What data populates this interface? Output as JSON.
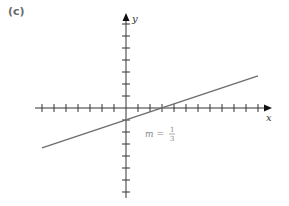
{
  "panel_label": "(c)",
  "chart_data": {
    "type": "line",
    "title": "",
    "xlabel": "x",
    "ylabel": "y",
    "xlim": [
      -7.5,
      12
    ],
    "ylim": [
      -7.5,
      7.5
    ],
    "grid": false,
    "ticks_every": 1,
    "series": [
      {
        "name": "line",
        "slope_label": "m = 1/3",
        "slope": 0.3333,
        "intercept": -1,
        "x": [
          -7,
          11
        ],
        "y": [
          -3.33,
          2.67
        ]
      }
    ],
    "annotations": [
      {
        "text": "m = 1/3",
        "x": 1.3,
        "y": -2
      }
    ]
  },
  "annotation": {
    "m": "m =",
    "num": "1",
    "den": "3"
  },
  "axes": {
    "x": "x",
    "y": "y"
  }
}
